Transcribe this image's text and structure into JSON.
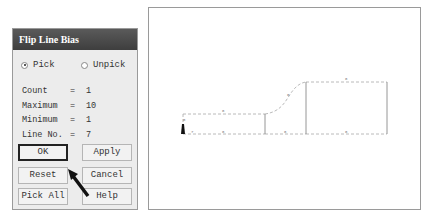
{
  "dialog": {
    "title": "Flip Line Bias",
    "radio_pick": "Pick",
    "radio_unpick": "Unpick",
    "selected_mode": "Pick",
    "info": [
      {
        "label": "Count",
        "eq": "=",
        "value": "1"
      },
      {
        "label": "Maximum",
        "eq": "=",
        "value": "10"
      },
      {
        "label": "Minimum",
        "eq": "=",
        "value": "1"
      },
      {
        "label": "Line No.",
        "eq": "=",
        "value": "7"
      }
    ],
    "buttons": {
      "ok": "OK",
      "apply": "Apply",
      "reset": "Reset",
      "cancel": "Cancel",
      "pick_all": "Pick All",
      "help": "Help"
    }
  },
  "viewport": {
    "line_division_labels": [
      "8",
      "8",
      "8",
      "8",
      "8",
      "8",
      "8",
      "7"
    ],
    "selected_line_label": "7",
    "colors": {
      "line": "#a0a0a0",
      "solid": "#888888"
    }
  }
}
